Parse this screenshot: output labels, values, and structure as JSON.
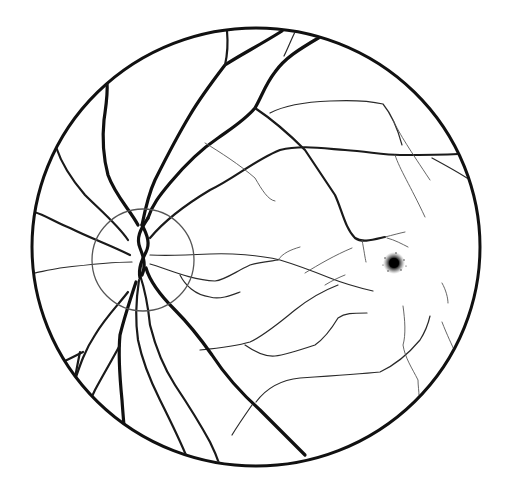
{
  "diagram": {
    "type": "retinal-fundus-illustration",
    "eye": "left",
    "background": "#ffffff",
    "ink": "#111111",
    "fundus_boundary": {
      "cx": 256,
      "cy": 247,
      "rx": 224,
      "ry": 219,
      "stroke_width": 3
    },
    "optic_disc": {
      "cx": 143,
      "cy": 260,
      "r": 51,
      "stroke": "#555555",
      "stroke_width": 1.3
    },
    "macula_fovea": {
      "cx": 394,
      "cy": 263,
      "r": 9,
      "color": "#111111"
    },
    "vessel_classes": [
      "major",
      "medium",
      "minor",
      "capillary"
    ]
  }
}
